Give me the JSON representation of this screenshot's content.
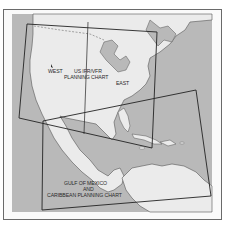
{
  "map": {
    "title": "Planning chart coverage index",
    "colors": {
      "water": "#b9b9b9",
      "land": "#ebebeb",
      "coast": "#555555",
      "chart_boundary": "#222222",
      "frame": "#6a6a6a"
    },
    "labels": {
      "west": "WEST",
      "us_chart_line1": "US IFR/VFR",
      "us_chart_line2": "PLANNING CHART",
      "east": "EAST",
      "gulf_line1": "GULF OF MEXICO",
      "gulf_line2": "AND",
      "gulf_line3": "CARIBBEAN PLANNING CHART"
    },
    "charts": [
      {
        "name": "US IFR/VFR Planning Chart",
        "sides": [
          "West",
          "East"
        ]
      },
      {
        "name": "Gulf of Mexico and Caribbean Planning Chart"
      }
    ]
  }
}
